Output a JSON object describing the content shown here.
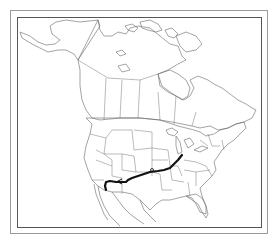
{
  "map": {
    "region": "North America",
    "features": [
      "Canada provinces",
      "United States states",
      "Mexico",
      "Alaska"
    ],
    "route": {
      "description": "Migration/route line from Great Lakes region southwest to Arizona",
      "color": "#111111",
      "start_region": "Ohio/Indiana",
      "end_region": "Arizona",
      "direction_arrow": "west"
    },
    "frame_color": "#555555",
    "background": "#ffffff"
  }
}
